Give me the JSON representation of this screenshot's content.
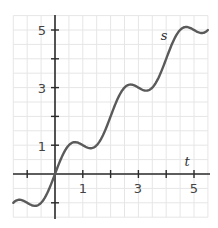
{
  "chart_data": {
    "type": "line",
    "title": "",
    "xlabel": "t",
    "ylabel": "s",
    "xlim": [
      -1.5,
      5.5
    ],
    "ylim": [
      -1.5,
      5.5
    ],
    "grid": true,
    "grid_step": 0.5,
    "x_ticks": [
      -1,
      0,
      1,
      2,
      3,
      4,
      5
    ],
    "x_tick_labels": [
      "",
      "",
      "1",
      "",
      "3",
      "",
      "5"
    ],
    "y_ticks": [
      -1,
      0,
      1,
      2,
      3,
      4,
      5
    ],
    "y_tick_labels": [
      "",
      "",
      "1",
      "",
      "3",
      "",
      "5"
    ],
    "series": [
      {
        "name": "s",
        "description": "s ≈ t + 0.5·sin(πt)",
        "x": [
          -1.5,
          -1.25,
          -1.0,
          -0.75,
          -0.5,
          -0.25,
          0,
          0.25,
          0.5,
          0.72,
          1.0,
          1.28,
          1.5,
          1.75,
          2.0,
          2.25,
          2.5,
          2.72,
          3.0,
          3.28,
          3.5,
          3.75,
          4.0,
          4.25,
          4.5,
          4.72,
          5.0,
          5.28,
          5.5
        ],
        "values": [
          -1.0,
          -0.9,
          -1.0,
          -1.1,
          -1.0,
          -0.6,
          0,
          0.6,
          1.0,
          1.11,
          1.0,
          0.89,
          1.0,
          1.4,
          2.0,
          2.6,
          3.0,
          3.11,
          3.0,
          2.89,
          3.0,
          3.4,
          4.0,
          4.6,
          5.0,
          5.11,
          5.0,
          4.89,
          5.0
        ]
      }
    ],
    "legend": null
  },
  "labels": {
    "x_var": "t",
    "y_var": "s",
    "x_1": "1",
    "x_3": "3",
    "x_5": "5",
    "y_1": "1",
    "y_3": "3",
    "y_5": "5"
  },
  "colors": {
    "curve": "#5a5a5a",
    "axis": "#2b2b2b",
    "grid": "#e6e6e6"
  }
}
